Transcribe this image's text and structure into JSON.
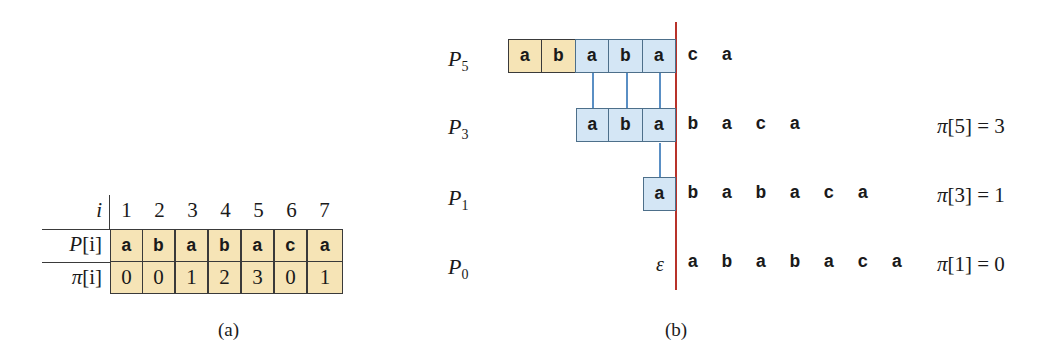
{
  "table_a": {
    "index_label": "i",
    "pattern_label_sym": "P",
    "pi_label_sym": "π",
    "bracket_i": "[i]",
    "indices": [
      "1",
      "2",
      "3",
      "4",
      "5",
      "6",
      "7"
    ],
    "pattern": [
      "a",
      "b",
      "a",
      "b",
      "a",
      "c",
      "a"
    ],
    "pi": [
      "0",
      "0",
      "1",
      "2",
      "3",
      "0",
      "1"
    ],
    "caption": "(a)"
  },
  "diagram_b": {
    "rows": [
      {
        "label_sym": "P",
        "label_sub": "5",
        "boxes": [
          {
            "char": "a",
            "color": "yellow"
          },
          {
            "char": "b",
            "color": "yellow"
          },
          {
            "char": "a",
            "color": "blue"
          },
          {
            "char": "b",
            "color": "blue"
          },
          {
            "char": "a",
            "color": "blue"
          }
        ],
        "trailing": [
          "c",
          "a"
        ],
        "annotation": ""
      },
      {
        "label_sym": "P",
        "label_sub": "3",
        "boxes": [
          {
            "char": "a",
            "color": "blue"
          },
          {
            "char": "b",
            "color": "blue"
          },
          {
            "char": "a",
            "color": "blue"
          }
        ],
        "trailing": [
          "b",
          "a",
          "c",
          "a"
        ],
        "annotation_sym": "π",
        "annotation_text": "[5] = 3"
      },
      {
        "label_sym": "P",
        "label_sub": "1",
        "boxes": [
          {
            "char": "a",
            "color": "blue"
          }
        ],
        "trailing": [
          "b",
          "a",
          "b",
          "a",
          "c",
          "a"
        ],
        "annotation_sym": "π",
        "annotation_text": "[3] = 1"
      },
      {
        "label_sym": "P",
        "label_sub": "0",
        "empty_symbol": "ε",
        "boxes": [],
        "trailing": [
          "a",
          "b",
          "a",
          "b",
          "a",
          "c",
          "a"
        ],
        "annotation_sym": "π",
        "annotation_text": "[1] = 0"
      }
    ],
    "caption": "(b)",
    "colors": {
      "yellow": "#f6e4b6",
      "blue": "#d4e6f5",
      "connector": "#5a8fc4",
      "divider": "#b8322a"
    }
  }
}
